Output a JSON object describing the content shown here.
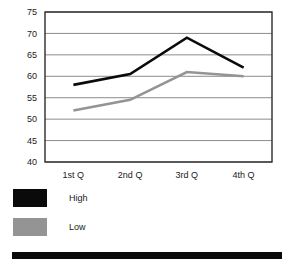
{
  "chart_data": {
    "type": "line",
    "title": "",
    "subtitle": "",
    "xlabel": "",
    "ylabel": "",
    "categories": [
      "1st Q",
      "2nd Q",
      "3rd Q",
      "4th Q"
    ],
    "series": [
      {
        "name": "High",
        "color": "#0a0a0a",
        "values": [
          58,
          60.5,
          69,
          62
        ]
      },
      {
        "name": "Low",
        "color": "#949494",
        "values": [
          52,
          54.5,
          61,
          60
        ]
      }
    ],
    "ylim": [
      40,
      75
    ],
    "yticks": [
      40,
      45,
      50,
      55,
      60,
      65,
      70,
      75
    ],
    "ytick_labels": [
      "40",
      "45",
      "50",
      "55",
      "60",
      "65",
      "70",
      "75"
    ],
    "grid": true,
    "grid_axis": "y",
    "grid_color": "#8c8c8c",
    "plot_border_color": "#2b2b2b",
    "plot_background": "#ffffff",
    "legend_position": "below-left",
    "legend": [
      {
        "label": "High",
        "color": "#0a0a0a"
      },
      {
        "label": "Low",
        "color": "#949494"
      }
    ]
  },
  "footer": {
    "rule_color": "#0a0a0a"
  }
}
